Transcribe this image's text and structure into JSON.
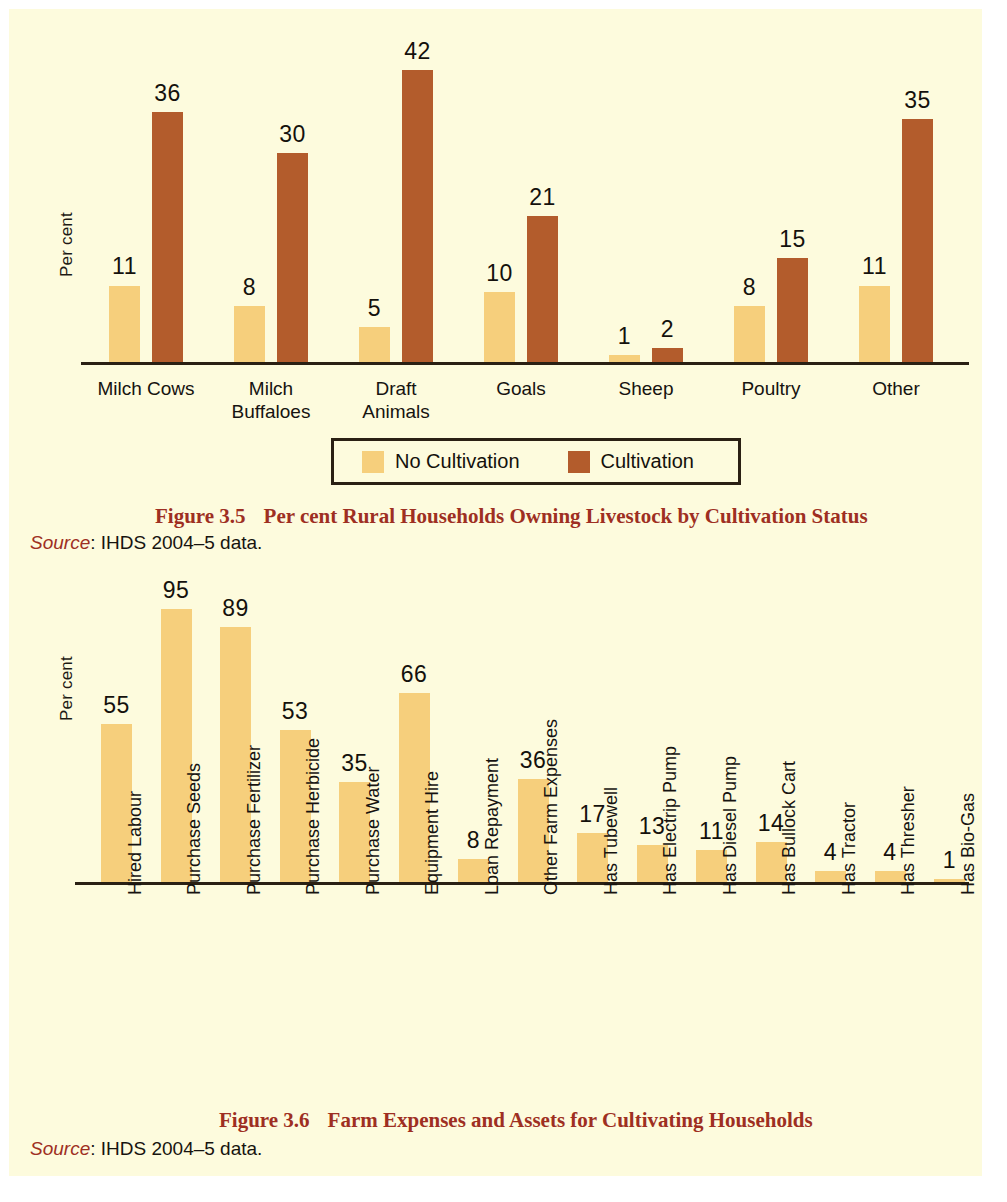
{
  "page": {
    "background_color": "#fdfbdd",
    "bar_color_no_cultivation": "#f6cf7c",
    "bar_color_cultivation": "#b35c2c",
    "caption_color": "#9e2f22"
  },
  "figure_35": {
    "ylabel": "Per cent",
    "legend": {
      "items": [
        {
          "label": "No Cultivation",
          "color": "#f6cf7c"
        },
        {
          "label": "Cultivation",
          "color": "#b35c2c"
        }
      ]
    },
    "caption_number": "Figure 3.5",
    "caption_title": "Per cent Rural Households Owning Livestock by Cultivation Status",
    "source_word": "Source",
    "source_text": ": IHDS 2004–5 data."
  },
  "figure_36": {
    "ylabel": "Per cent",
    "caption_number": "Figure 3.6",
    "caption_title": "Farm Expenses and Assets for Cultivating Households",
    "source_word": "Source",
    "source_text": ": IHDS 2004–5 data."
  },
  "chart_data": [
    {
      "id": "figure_3_5",
      "type": "bar",
      "title": "Per cent Rural Households Owning Livestock by Cultivation Status",
      "xlabel": "",
      "ylabel": "Per cent",
      "ylim": [
        0,
        45
      ],
      "grid": false,
      "legend_position": "bottom",
      "categories": [
        "Milch Cows",
        "Milch Buffaloes",
        "Draft Animals",
        "Goals",
        "Sheep",
        "Poultry",
        "Other"
      ],
      "category_lines": [
        [
          "Milch Cows"
        ],
        [
          "Milch",
          "Buffaloes"
        ],
        [
          "Draft",
          "Animals"
        ],
        [
          "Goals"
        ],
        [
          "Sheep"
        ],
        [
          "Poultry"
        ],
        [
          "Other"
        ]
      ],
      "series": [
        {
          "name": "No Cultivation",
          "color": "#f6cf7c",
          "values": [
            11,
            8,
            5,
            10,
            1,
            8,
            11
          ]
        },
        {
          "name": "Cultivation",
          "color": "#b35c2c",
          "values": [
            36,
            30,
            42,
            21,
            2,
            15,
            35
          ]
        }
      ],
      "source": "IHDS 2004–5 data."
    },
    {
      "id": "figure_3_6",
      "type": "bar",
      "title": "Farm Expenses and Assets for Cultivating Households",
      "xlabel": "",
      "ylabel": "Per cent",
      "ylim": [
        0,
        100
      ],
      "grid": false,
      "legend_position": "none",
      "categories": [
        "Hired Labour",
        "Purchase Seeds",
        "Purchase Fertilizer",
        "Purchase Herbicide",
        "Purchase Water",
        "Equipment Hire",
        "Loan Repayment",
        "Other Farm Expenses",
        "Has Tubewell",
        "Has Electrip Pump",
        "Has Diesel Pump",
        "Has Bullock Cart",
        "Has Tractor",
        "Has Thresher",
        "Has Bio-Gas"
      ],
      "series": [
        {
          "name": "Per cent",
          "color": "#f6cf7c",
          "values": [
            55,
            95,
            89,
            53,
            35,
            66,
            8,
            36,
            17,
            13,
            11,
            14,
            4,
            4,
            1
          ]
        }
      ],
      "source": "IHDS 2004–5 data."
    }
  ]
}
